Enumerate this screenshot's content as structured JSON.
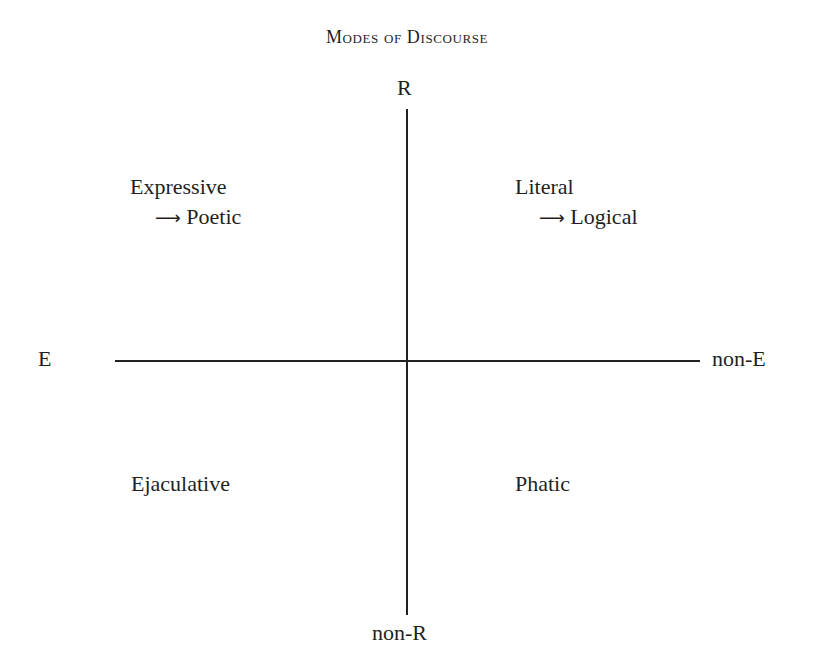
{
  "title": "Modes of Discourse",
  "axes": {
    "vertical": {
      "top_label": "R",
      "bottom_label": "non-R"
    },
    "horizontal": {
      "left_label": "E",
      "right_label": "non-E"
    }
  },
  "quadrants": {
    "top_left": {
      "primary": "Expressive",
      "arrow": "⟶",
      "secondary": "Poetic"
    },
    "top_right": {
      "primary": "Literal",
      "arrow": "⟶",
      "secondary": "Logical"
    },
    "bottom_left": {
      "primary": "Ejaculative"
    },
    "bottom_right": {
      "primary": "Phatic"
    }
  }
}
